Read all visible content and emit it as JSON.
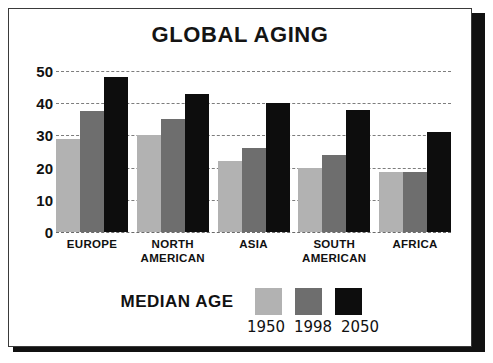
{
  "chart_data": {
    "type": "bar",
    "title": "GLOBAL AGING",
    "xlabel": "",
    "ylabel": "",
    "ylim": [
      0,
      50
    ],
    "yticks": [
      0,
      10,
      20,
      30,
      40,
      50
    ],
    "grid": true,
    "legend_title": "MEDIAN AGE",
    "legend_position": "bottom",
    "categories": [
      "EUROPE",
      "NORTH AMERICAN",
      "ASIA",
      "SOUTH AMERICAN",
      "AFRICA"
    ],
    "category_lines": [
      [
        "EUROPE"
      ],
      [
        "NORTH",
        "AMERICAN"
      ],
      [
        "ASIA"
      ],
      [
        "SOUTH",
        "AMERICAN"
      ],
      [
        "AFRICA"
      ]
    ],
    "series": [
      {
        "name": "1950",
        "color": "#b2b2b2",
        "values": [
          29,
          30,
          22,
          20,
          18.5
        ]
      },
      {
        "name": "1998",
        "color": "#6e6e6e",
        "values": [
          37.5,
          35,
          26,
          24,
          18.5
        ]
      },
      {
        "name": "2050",
        "color": "#0d0d0d",
        "values": [
          48,
          43,
          40,
          38,
          31
        ]
      }
    ]
  },
  "colors": {
    "series_1950": "#b2b2b2",
    "series_1998": "#6e6e6e",
    "series_2050": "#0d0d0d",
    "card_border": "#3a3a3a",
    "gridline": "#7d7d7d",
    "text": "#111111",
    "shadow": "#111111"
  },
  "yticks": {
    "t50": "50",
    "t40": "40",
    "t30": "30",
    "t20": "20",
    "t10": "10",
    "t0": "0"
  },
  "legend": {
    "title": "MEDIAN AGE",
    "years": [
      "1950",
      "1998",
      "2050"
    ]
  }
}
